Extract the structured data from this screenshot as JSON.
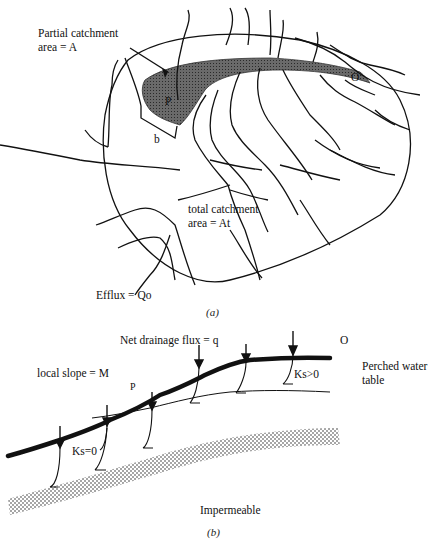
{
  "panel_a": {
    "labels": {
      "partial_catchment_line1": "Partial catchment",
      "partial_catchment_line2": "area = A",
      "point_p": "P",
      "contour_width": "b",
      "outlet": "O",
      "total_catchment_line1": "total catchment",
      "total_catchment_line2": "area = At",
      "efflux": "Efflux = Qo"
    },
    "caption": "(a)"
  },
  "panel_b": {
    "labels": {
      "net_drainage": "Net drainage flux = q",
      "outlet": "O",
      "local_slope": "local slope = M",
      "point_p": "P",
      "ks_positive": "Ks>0",
      "ks_zero": "Ks=0",
      "perched_line1": "Perched water",
      "perched_line2": "table",
      "impermeable": "Impermeable"
    },
    "caption": "(b)"
  }
}
